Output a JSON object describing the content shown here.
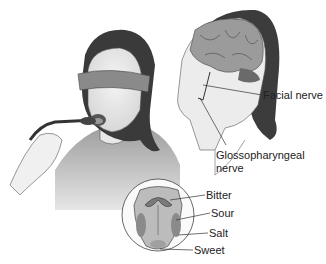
{
  "figure": {
    "panels": [
      "blindfolded-taste-test",
      "head-with-brain-and-nerves",
      "tongue-taste-regions"
    ]
  },
  "labels": {
    "facial_nerve": "Facial nerve",
    "glosso_line1": "Glossopharyngeal",
    "glosso_line2": "nerve",
    "bitter": "Bitter",
    "sour": "Sour",
    "salt": "Salt",
    "sweet": "Sweet"
  }
}
